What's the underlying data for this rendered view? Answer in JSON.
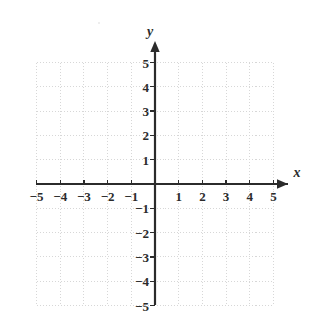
{
  "figure": {
    "kind": "cartesian-coordinate-plane",
    "width": 320,
    "height": 317,
    "background_color": "#ffffff"
  },
  "chart_data": {
    "type": "scatter",
    "title": "",
    "subtitle": "",
    "xlabel": "x",
    "ylabel": "y",
    "xlim": [
      -5,
      5
    ],
    "ylim": [
      -5,
      5
    ],
    "xticks": [
      -5,
      -4,
      -3,
      -2,
      -1,
      1,
      2,
      3,
      4,
      5
    ],
    "yticks": [
      5,
      4,
      3,
      2,
      1,
      -1,
      -2,
      -3,
      -4,
      -5
    ],
    "xtick_labels": [
      "−5",
      "−4",
      "−3",
      "−2",
      "−1",
      "1",
      "2",
      "3",
      "4",
      "5"
    ],
    "ytick_labels": [
      "5",
      "4",
      "3",
      "2",
      "1",
      "−1",
      "−2",
      "−3",
      "−4",
      "−5"
    ],
    "grid": true,
    "grid_style": "dotted",
    "grid_step": 1,
    "legend": null,
    "series": [],
    "annotations": [],
    "axis_arrows": [
      "x-positive",
      "y-positive"
    ],
    "origin_label": ""
  },
  "colors": {
    "axis": "#2b2b2b",
    "grid": "#d7d7d7",
    "text": "#2b2b2b",
    "background": "#ffffff"
  },
  "geometry": {
    "origin_x": 155,
    "origin_y": 184,
    "unit_x": 23.7,
    "unit_y": 24.3,
    "grid_left": 36.5,
    "grid_right": 273.5,
    "grid_top": 62.5,
    "grid_bottom": 305.5
  },
  "axis_names": {
    "x": "x",
    "y": "y"
  }
}
